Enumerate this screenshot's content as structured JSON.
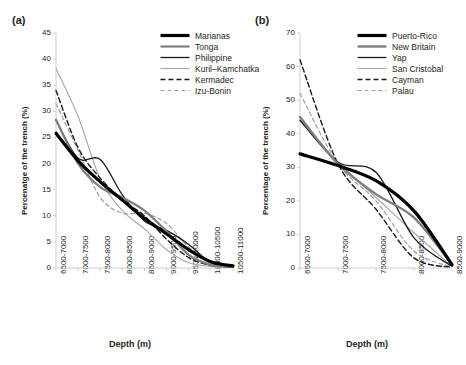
{
  "figure": {
    "panel_a_tag": "(a)",
    "panel_b_tag": "(b)",
    "xlabel": "Depth (m)",
    "ylabel_a": "Percenatge of the trench (%)",
    "ylabel_b": "Percentage of the trench (%)"
  },
  "chart_data": [
    {
      "type": "line",
      "panel": "(a)",
      "title": "",
      "xlabel": "Depth (m)",
      "ylabel": "Percenatge of the trench (%)",
      "ylim": [
        0,
        45
      ],
      "yticks": [
        0,
        5,
        10,
        15,
        20,
        25,
        30,
        35,
        40,
        45
      ],
      "grid": false,
      "legend_position": "top-right",
      "categories": [
        "6500-7000",
        "7000-7500",
        "7500-8000",
        "8000-8500",
        "8500-9000",
        "9000-9500",
        "9500-10000",
        "10000-10500",
        "10500-11000"
      ],
      "series": [
        {
          "name": "Marianas",
          "color": "#000000",
          "width": 3.2,
          "dash": "none",
          "values": [
            25.8,
            20.5,
            16.5,
            13.0,
            9.5,
            6.5,
            3.5,
            1.2,
            0.4
          ]
        },
        {
          "name": "Tonga",
          "color": "#7f7f7f",
          "width": 2.2,
          "dash": "none",
          "values": [
            28.4,
            20.0,
            15.5,
            13.5,
            11.0,
            7.0,
            2.5,
            0.6,
            0.2
          ]
        },
        {
          "name": "Philippine",
          "color": "#1a1a1a",
          "width": 1.3,
          "dash": "none",
          "values": [
            28.3,
            21.0,
            20.8,
            14.0,
            9.0,
            7.2,
            4.5,
            1.0,
            0.2
          ]
        },
        {
          "name": "Kuril–Kamchatka",
          "color": "#a6a6a6",
          "width": 1.1,
          "dash": "none",
          "values": [
            38.2,
            29.0,
            17.0,
            11.0,
            7.5,
            3.5,
            1.0,
            0.3,
            0.1
          ]
        },
        {
          "name": "Kermadec",
          "color": "#1a1a1a",
          "width": 1.4,
          "dash": "dashed",
          "values": [
            34.0,
            23.0,
            17.2,
            13.0,
            10.0,
            5.5,
            2.0,
            0.5,
            0.2
          ]
        },
        {
          "name": "Izu-Bonin",
          "color": "#9e9e9e",
          "width": 1.2,
          "dash": "dashed",
          "values": [
            31.5,
            22.5,
            13.5,
            10.5,
            10.5,
            8.5,
            4.0,
            1.0,
            0.3
          ]
        }
      ]
    },
    {
      "type": "line",
      "panel": "(b)",
      "title": "",
      "xlabel": "Depth (m)",
      "ylabel": "Percentage of the trench (%)",
      "ylim": [
        0,
        70
      ],
      "yticks": [
        0,
        10,
        20,
        30,
        40,
        50,
        60,
        70
      ],
      "grid": false,
      "legend_position": "top-right",
      "categories": [
        "6500-7000",
        "7000-7500",
        "7500-8000",
        "8000-8500",
        "8500-9000"
      ],
      "series": [
        {
          "name": "Puerto-Rico",
          "color": "#000000",
          "width": 3.2,
          "dash": "none",
          "values": [
            34.0,
            30.5,
            26.0,
            17.0,
            1.0
          ]
        },
        {
          "name": "New Britain",
          "color": "#7f7f7f",
          "width": 2.4,
          "dash": "none",
          "values": [
            45.0,
            31.0,
            22.0,
            15.0,
            1.0
          ]
        },
        {
          "name": "Yap",
          "color": "#1a1a1a",
          "width": 1.3,
          "dash": "none",
          "values": [
            44.0,
            31.5,
            28.5,
            9.0,
            0.5
          ]
        },
        {
          "name": "San Cristobal",
          "color": "#a6a6a6",
          "width": 1.1,
          "dash": "none",
          "values": [
            44.0,
            31.5,
            21.0,
            10.5,
            0.5
          ]
        },
        {
          "name": "Cayman",
          "color": "#1a1a1a",
          "width": 1.4,
          "dash": "dashed",
          "values": [
            62.0,
            31.0,
            17.5,
            3.0,
            0.2
          ]
        },
        {
          "name": "Palau",
          "color": "#9e9e9e",
          "width": 1.2,
          "dash": "dashed",
          "values": [
            52.0,
            31.0,
            20.0,
            5.0,
            0.3
          ]
        }
      ]
    }
  ]
}
